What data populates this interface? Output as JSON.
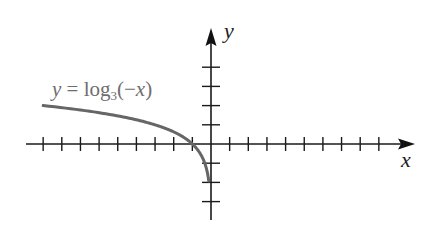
{
  "chart_data": {
    "type": "line",
    "title": "",
    "xlabel": "x",
    "ylabel": "y",
    "function": "y = log_3(-x)",
    "annotation": {
      "parts": {
        "y": "y",
        "eq": " = log",
        "base": "3",
        "open": "(−",
        "x": "x",
        "close": ")"
      },
      "text": "y = log3(−x)"
    },
    "xlim": [
      -10,
      11
    ],
    "ylim": [
      -4,
      6
    ],
    "x_ticks_left": 9,
    "x_ticks_right": 9,
    "y_ticks_up": 4,
    "y_ticks_down": 3,
    "tick_labels_shown": false,
    "grid": false,
    "series": [
      {
        "name": "y = log3(-x)",
        "color": "#666666",
        "x": [
          -9,
          -8,
          -7,
          -6,
          -5,
          -4,
          -3,
          -2,
          -1,
          -0.5,
          -0.33,
          -0.2,
          -0.12
        ],
        "y": [
          2,
          1.89,
          1.77,
          1.63,
          1.46,
          1.26,
          1,
          0.63,
          0,
          -0.63,
          -1,
          -1.46,
          -1.93
        ]
      }
    ]
  },
  "style": {
    "axis_color": "#1a1a1a",
    "curve_color": "#666666",
    "label_color": "#6e6e6e"
  },
  "axes": {
    "x_label": "x",
    "y_label": "y"
  }
}
